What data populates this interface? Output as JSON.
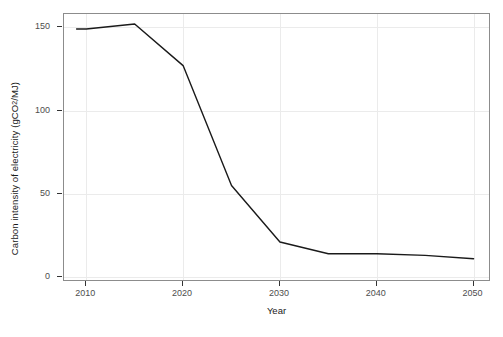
{
  "chart_data": {
    "type": "line",
    "title": "",
    "subtitle": "",
    "xlabel": "Year",
    "ylabel_text": "Carbon intensity of electricity (gCO",
    "ylabel_sub": "2",
    "ylabel_tail": "/MJ)",
    "ylabel_full": "Carbon intensity of electricity (gCO2/MJ)",
    "x": [
      2009,
      2010,
      2015,
      2020,
      2025,
      2030,
      2035,
      2040,
      2045,
      2050
    ],
    "values": [
      149,
      149,
      152,
      127,
      55,
      21,
      14,
      14,
      13,
      11
    ],
    "series": [
      {
        "name": "Carbon intensity of electricity",
        "color": "#1a1a1a",
        "values": [
          149,
          149,
          152,
          127,
          55,
          21,
          14,
          14,
          13,
          11
        ]
      }
    ],
    "xlim": [
      2007.7,
      2051.8
    ],
    "ylim": [
      -3,
      158
    ],
    "xticks": [
      2010,
      2020,
      2030,
      2040,
      2050
    ],
    "xtick_labels": [
      "2010",
      "2020",
      "2030",
      "2040",
      "2050"
    ],
    "yticks": [
      0,
      50,
      100,
      150
    ],
    "ytick_labels": [
      "0",
      "50",
      "100",
      "150"
    ],
    "grid": true,
    "grid_color": "#ebebeb",
    "legend": "none",
    "panel_border_color": "#8c8c8c",
    "background": "#ffffff"
  }
}
